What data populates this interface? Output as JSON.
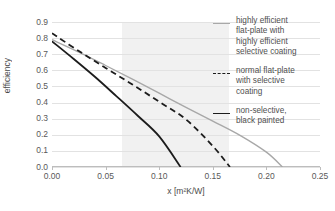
{
  "chart_data": {
    "type": "line",
    "title": "",
    "xlabel": "x [m²K/W]",
    "ylabel": "efficiency",
    "xlim": [
      0.0,
      0.25
    ],
    "ylim": [
      0.0,
      0.9
    ],
    "xticks": [
      "0.00",
      "0.05",
      "0.10",
      "0.15",
      "0.20",
      "0.25"
    ],
    "xtick_values": [
      0.0,
      0.05,
      0.1,
      0.15,
      0.2,
      0.25
    ],
    "yticks": [
      "0.0",
      "0.1",
      "0.2",
      "0.3",
      "0.4",
      "0.5",
      "0.6",
      "0.7",
      "0.8",
      "0.9"
    ],
    "ytick_values": [
      0.0,
      0.1,
      0.2,
      0.3,
      0.4,
      0.5,
      0.6,
      0.7,
      0.8,
      0.9
    ],
    "grid": "horizontal",
    "legend_position": "right",
    "shaded_band": {
      "x_start": 0.065,
      "x_end": 0.165,
      "color": "#f1f1f1"
    },
    "series": [
      {
        "name": "highly efficient flat-plate with highly efficient selective coating",
        "style": "solid",
        "color": "#a8a8a8",
        "width": 1.4,
        "points": [
          [
            0.0,
            0.79
          ],
          [
            0.025,
            0.713
          ],
          [
            0.05,
            0.63
          ],
          [
            0.075,
            0.545
          ],
          [
            0.1,
            0.458
          ],
          [
            0.125,
            0.37
          ],
          [
            0.15,
            0.285
          ],
          [
            0.175,
            0.198
          ],
          [
            0.2,
            0.092
          ],
          [
            0.215,
            0.0
          ]
        ]
      },
      {
        "name": "normal flat-plate with selective coating",
        "style": "dashed",
        "color": "#1c1c1c",
        "width": 1.8,
        "points": [
          [
            0.0,
            0.83
          ],
          [
            0.025,
            0.72
          ],
          [
            0.05,
            0.615
          ],
          [
            0.075,
            0.512
          ],
          [
            0.1,
            0.405
          ],
          [
            0.125,
            0.295
          ],
          [
            0.15,
            0.13
          ],
          [
            0.166,
            0.0
          ]
        ]
      },
      {
        "name": "non-selective, black painted",
        "style": "solid",
        "color": "#1c1c1c",
        "width": 1.8,
        "points": [
          [
            0.0,
            0.78
          ],
          [
            0.02,
            0.672
          ],
          [
            0.04,
            0.56
          ],
          [
            0.06,
            0.44
          ],
          [
            0.08,
            0.318
          ],
          [
            0.1,
            0.19
          ],
          [
            0.12,
            0.0
          ]
        ]
      }
    ]
  },
  "legend": {
    "entries": [
      {
        "label": "highly efficient\nflat-plate with\nhighly efficient\nselective coating",
        "marker": "solid-gray"
      },
      {
        "label": "normal flat-plate\nwith selective\ncoating",
        "marker": "dashed-black"
      },
      {
        "label": "non-selective,\nblack painted",
        "marker": "solid-black"
      }
    ]
  },
  "axes": {
    "x_title": "x [m²K/W]",
    "y_title": "efficiency"
  }
}
